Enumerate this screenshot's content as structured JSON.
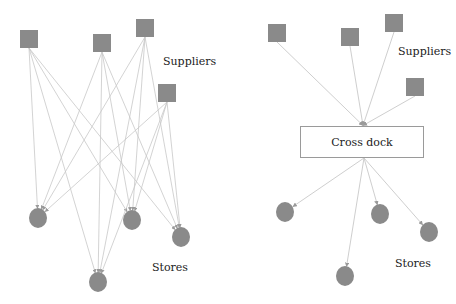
{
  "colors": {
    "node_fill": "#8a8a8a",
    "edge": "#c8c8c8",
    "arrow": "#9a9a9a",
    "text": "#222222",
    "box_border": "#9a9a9a"
  },
  "left_panel": {
    "title": "Direct shipment network",
    "suppliers_label": "Suppliers",
    "stores_label": "Stores",
    "suppliers": [
      {
        "id": "L-S1",
        "x": 20,
        "y": 30,
        "size": 18
      },
      {
        "id": "L-S2",
        "x": 93,
        "y": 34,
        "size": 18
      },
      {
        "id": "L-S3",
        "x": 136,
        "y": 19,
        "size": 18
      },
      {
        "id": "L-S4",
        "x": 158,
        "y": 84,
        "size": 18
      }
    ],
    "stores": [
      {
        "id": "L-T1",
        "cx": 38,
        "cy": 218,
        "r": 9
      },
      {
        "id": "L-T2",
        "cx": 98,
        "cy": 282,
        "r": 9
      },
      {
        "id": "L-T3",
        "cx": 132,
        "cy": 220,
        "r": 9
      },
      {
        "id": "L-T4",
        "cx": 181,
        "cy": 237,
        "r": 9
      }
    ],
    "edges": "all-to-all (4 suppliers x 4 stores = 16)"
  },
  "right_panel": {
    "title": "Cross-docking network",
    "suppliers_label": "Suppliers",
    "stores_label": "Stores",
    "hub_label": "Cross dock",
    "hub": {
      "x": 300,
      "y": 126,
      "w": 124,
      "h": 32
    },
    "suppliers": [
      {
        "id": "R-S1",
        "x": 268,
        "y": 24,
        "size": 18
      },
      {
        "id": "R-S2",
        "x": 341,
        "y": 28,
        "size": 18
      },
      {
        "id": "R-S3",
        "x": 385,
        "y": 14,
        "size": 18
      },
      {
        "id": "R-S4",
        "x": 406,
        "y": 78,
        "size": 18
      }
    ],
    "stores": [
      {
        "id": "R-T1",
        "cx": 285,
        "cy": 212,
        "r": 9
      },
      {
        "id": "R-T2",
        "cx": 345,
        "cy": 276,
        "r": 9
      },
      {
        "id": "R-T3",
        "cx": 380,
        "cy": 214,
        "r": 9
      },
      {
        "id": "R-T4",
        "cx": 429,
        "cy": 232,
        "r": 9
      }
    ]
  }
}
